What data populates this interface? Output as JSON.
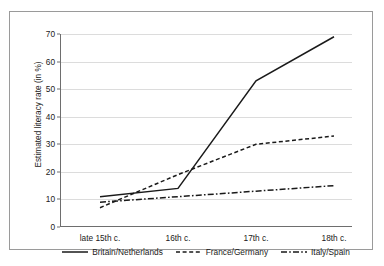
{
  "chart_data": {
    "type": "line",
    "title": "",
    "xlabel": "",
    "ylabel": "Estimated literacy rate (in %)",
    "categories": [
      "late 15th c.",
      "16th c.",
      "17th c.",
      "18th c."
    ],
    "yticks": [
      0,
      10,
      20,
      30,
      40,
      50,
      60,
      70
    ],
    "ytick_labels": [
      "0",
      "10",
      "20",
      "30",
      "40",
      "50",
      "60",
      "70"
    ],
    "ylim": [
      0,
      70
    ],
    "grid": "horizontal",
    "legend_position": "bottom",
    "series": [
      {
        "name": "Britain/Netherlands",
        "style": "solid",
        "color": "#1a1a1a",
        "values": [
          11,
          14,
          53,
          69
        ]
      },
      {
        "name": "France/Germany",
        "style": "dashed",
        "color": "#1a1a1a",
        "values": [
          7,
          19,
          30,
          33
        ]
      },
      {
        "name": "Italy/Spain",
        "style": "dash-dot",
        "color": "#1a1a1a",
        "values": [
          9,
          11,
          13,
          15
        ]
      }
    ]
  },
  "legend": {
    "items": [
      {
        "label": "Britain/Netherlands",
        "style": "solid"
      },
      {
        "label": "France/Germany",
        "style": "dashed"
      },
      {
        "label": "Italy/Spain",
        "style": "dash-dot"
      }
    ]
  },
  "axes": {
    "y_title": "Estimated literacy rate (in %)"
  }
}
